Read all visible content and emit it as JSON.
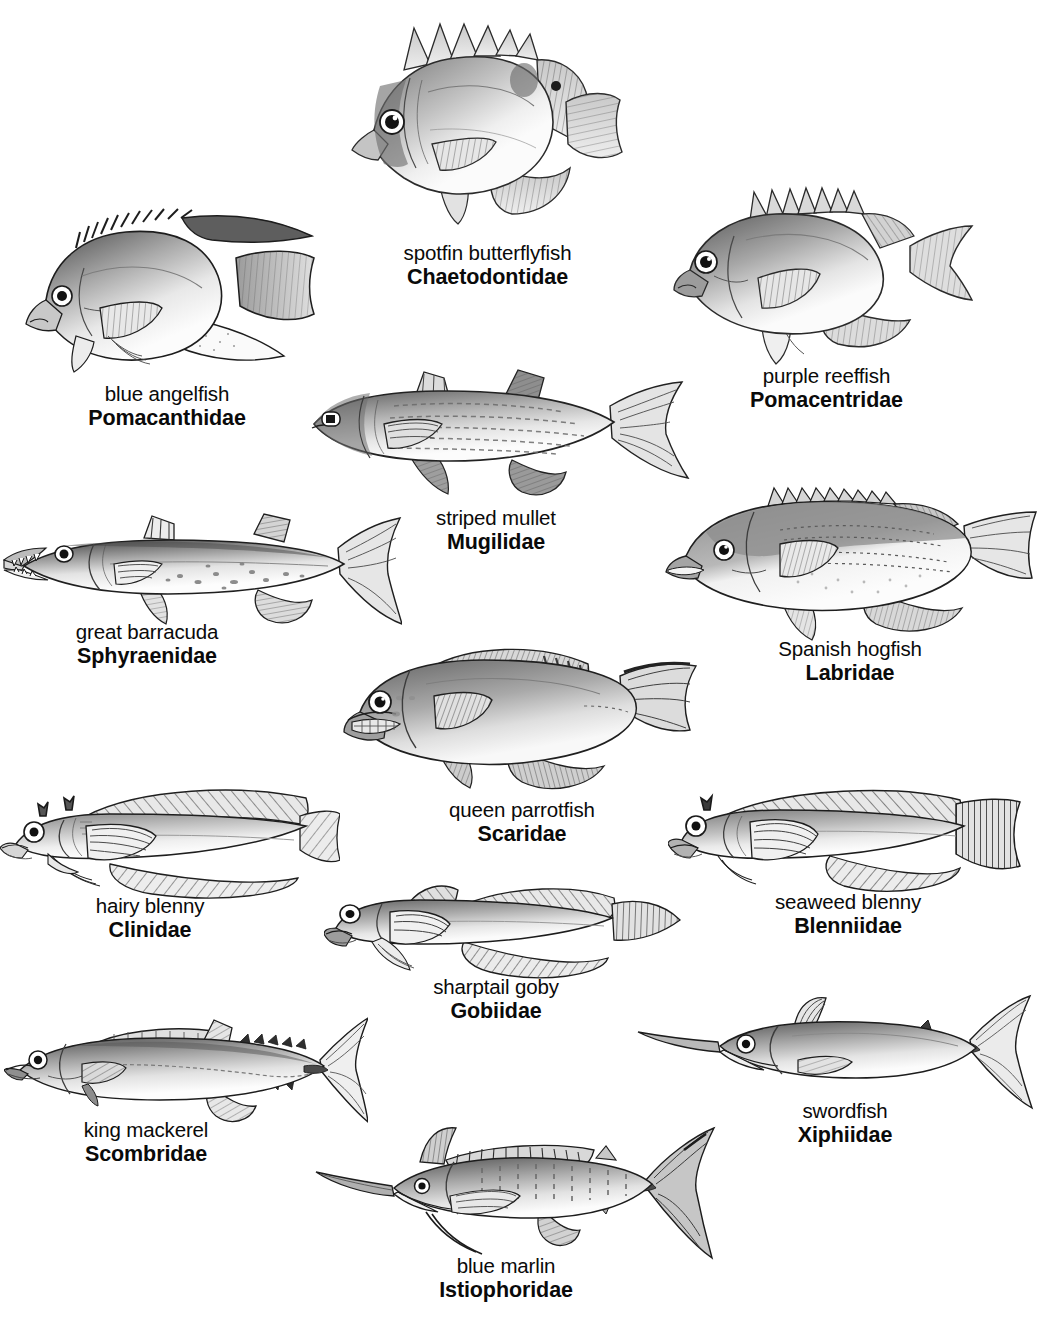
{
  "plate": {
    "title": "Marine fish families illustration plate",
    "background_color": "#ffffff",
    "text_color": "#0a0a0a",
    "width": 1042,
    "height": 1324
  },
  "fishes": [
    {
      "id": "chaetodontidae",
      "common_name": "spotfin butterflyfish",
      "family_name": "Chaetodontidae",
      "icon": "butterflyfish-icon",
      "body_shape": "disc",
      "orientation": "left-facing",
      "art": {
        "x": 344,
        "y": 18,
        "w": 286,
        "h": 222
      },
      "label": {
        "x": 395,
        "y": 241,
        "w": 215
      }
    },
    {
      "id": "pomacanthidae",
      "common_name": "blue angelfish",
      "family_name": "Pomacanthidae",
      "icon": "angelfish-icon",
      "body_shape": "disc-trailing-fins",
      "orientation": "left-facing",
      "art": {
        "x": 28,
        "y": 196,
        "w": 310,
        "h": 180
      },
      "label": {
        "x": 90,
        "y": 382,
        "w": 195
      }
    },
    {
      "id": "pomacentridae",
      "common_name": "purple reeffish",
      "family_name": "Pomacentridae",
      "icon": "damselfish-icon",
      "body_shape": "oval",
      "orientation": "left-facing",
      "art": {
        "x": 675,
        "y": 178,
        "w": 300,
        "h": 180
      },
      "label": {
        "x": 738,
        "y": 367,
        "w": 200
      }
    },
    {
      "id": "mugilidae",
      "common_name": "striped mullet",
      "family_name": "Mugilidae",
      "icon": "mullet-icon",
      "body_shape": "fusiform",
      "orientation": "left-facing",
      "art": {
        "x": 300,
        "y": 366,
        "w": 390,
        "h": 140
      },
      "label": {
        "x": 428,
        "y": 506,
        "w": 160
      }
    },
    {
      "id": "sphyraenidae",
      "common_name": "great barracuda",
      "family_name": "Sphyraenidae",
      "icon": "barracuda-icon",
      "body_shape": "elongate",
      "orientation": "left-facing",
      "art": {
        "x": 6,
        "y": 508,
        "w": 394,
        "h": 115
      },
      "label": {
        "x": 92,
        "y": 617,
        "w": 196
      }
    },
    {
      "id": "labridae",
      "common_name": "Spanish hogfish",
      "family_name": "Labridae",
      "icon": "hogfish-icon",
      "body_shape": "oval-elongate",
      "orientation": "left-facing",
      "art": {
        "x": 664,
        "y": 482,
        "w": 378,
        "h": 160
      },
      "label": {
        "x": 778,
        "y": 637,
        "w": 185
      }
    },
    {
      "id": "scaridae",
      "common_name": "queen parrotfish",
      "family_name": "Scaridae",
      "icon": "parrotfish-icon",
      "body_shape": "oval-elongate",
      "orientation": "left-facing",
      "art": {
        "x": 340,
        "y": 636,
        "w": 360,
        "h": 162
      },
      "label": {
        "x": 440,
        "y": 799,
        "w": 190
      }
    },
    {
      "id": "clinidae",
      "common_name": "hairy blenny",
      "family_name": "Clinidae",
      "icon": "blenny-icon",
      "body_shape": "elongate-blenny",
      "orientation": "left-facing",
      "art": {
        "x": 4,
        "y": 782,
        "w": 330,
        "h": 120
      },
      "label": {
        "x": 100,
        "y": 896,
        "w": 160
      }
    },
    {
      "id": "blenniidae",
      "common_name": "seaweed blenny",
      "family_name": "Blenniidae",
      "icon": "blenny-icon",
      "body_shape": "elongate-blenny",
      "orientation": "left-facing",
      "art": {
        "x": 672,
        "y": 780,
        "w": 350,
        "h": 122
      },
      "label": {
        "x": 770,
        "y": 895,
        "w": 195
      }
    },
    {
      "id": "gobiidae",
      "common_name": "sharptail goby",
      "family_name": "Gobiidae",
      "icon": "goby-icon",
      "body_shape": "elongate-goby",
      "orientation": "left-facing",
      "art": {
        "x": 326,
        "y": 876,
        "w": 352,
        "h": 104
      },
      "label": {
        "x": 412,
        "y": 955,
        "w": 180
      }
    },
    {
      "id": "scombridae",
      "common_name": "king mackerel",
      "family_name": "Scombridae",
      "icon": "mackerel-icon",
      "body_shape": "fusiform-tuna",
      "orientation": "left-facing",
      "art": {
        "x": 8,
        "y": 1012,
        "w": 356,
        "h": 115
      },
      "label": {
        "x": 96,
        "y": 1118,
        "w": 172
      }
    },
    {
      "id": "xiphiidae",
      "common_name": "swordfish",
      "family_name": "Xiphiidae",
      "icon": "swordfish-icon",
      "body_shape": "billfish",
      "orientation": "left-facing",
      "art": {
        "x": 640,
        "y": 994,
        "w": 396,
        "h": 118
      },
      "label": {
        "x": 790,
        "y": 1105,
        "w": 140
      }
    },
    {
      "id": "istiophoridae",
      "common_name": "blue marlin",
      "family_name": "Istiophoridae",
      "icon": "marlin-icon",
      "body_shape": "billfish",
      "orientation": "left-facing",
      "art": {
        "x": 310,
        "y": 1126,
        "w": 400,
        "h": 140
      },
      "label": {
        "x": 430,
        "y": 1262,
        "w": 175
      }
    }
  ]
}
